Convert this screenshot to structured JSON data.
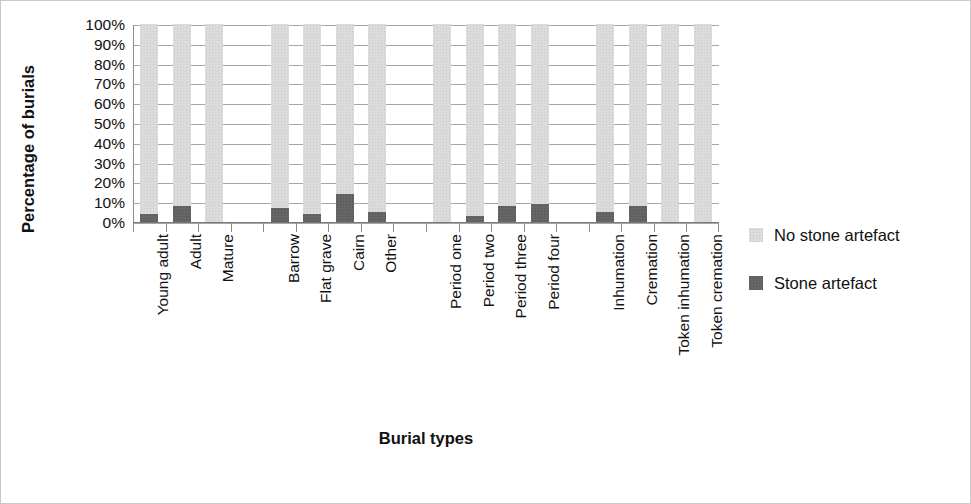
{
  "chart_data": {
    "type": "bar",
    "title": "",
    "subtitle": "",
    "xlabel": "Burial types",
    "ylabel": "Percentage of burials",
    "stacked": true,
    "stack_total": 100,
    "ylim": [
      0,
      100
    ],
    "ytick_labels": [
      "100%",
      "90%",
      "80%",
      "70%",
      "60%",
      "50%",
      "40%",
      "30%",
      "20%",
      "10%",
      "0%"
    ],
    "ytick_values": [
      100,
      90,
      80,
      70,
      60,
      50,
      40,
      30,
      20,
      10,
      0
    ],
    "grid": true,
    "legend_position": "right",
    "categories": [
      "Young adult",
      "Adult",
      "Mature",
      "",
      "Barrow",
      "Flat grave",
      "Cairn",
      "Other",
      "",
      "Period one",
      "Period two",
      "Period three",
      "Period four",
      "",
      "Inhumation",
      "Cremation",
      "Token inhumation",
      "Token cremation"
    ],
    "series": [
      {
        "name": "Stone artefact",
        "color": "#636363",
        "values": [
          4,
          8,
          0,
          null,
          7,
          4,
          14,
          5,
          null,
          0,
          3,
          8,
          9,
          null,
          5,
          8,
          0,
          0
        ]
      },
      {
        "name": "No stone artefact",
        "color": "#d9d9d9",
        "values": [
          96,
          92,
          100,
          null,
          93,
          96,
          86,
          95,
          null,
          100,
          97,
          92,
          91,
          null,
          95,
          92,
          100,
          100
        ]
      }
    ]
  },
  "legend": {
    "entries": [
      {
        "label": "No stone artefact",
        "swatch": "nostone"
      },
      {
        "label": "Stone artefact",
        "swatch": "stone"
      }
    ]
  }
}
